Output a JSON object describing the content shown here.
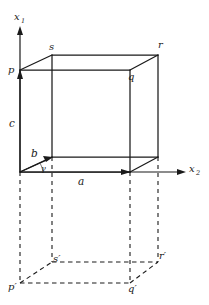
{
  "figure": {
    "type": "geometry-diagram",
    "background_color": "#ffffff",
    "line_color": "#1a1a1a",
    "axes": [
      {
        "name": "x1-axis",
        "label": "x",
        "subscript": "1",
        "direction": "up"
      },
      {
        "name": "x2-axis",
        "label": "x",
        "subscript": "2",
        "direction": "right"
      }
    ],
    "vertices": {
      "p": "p",
      "q": "q",
      "r": "r",
      "s": "s",
      "p_prime": "p",
      "q_prime": "q",
      "r_prime": "r",
      "s_prime": "s",
      "prime_mark": "′"
    },
    "edge_labels": {
      "a": "a",
      "b": "b",
      "c": "c"
    },
    "angle_labels": {
      "gamma": "γ"
    },
    "geometry": {
      "origin": [
        20,
        172
      ],
      "front_top_left": [
        20,
        70
      ],
      "front_top_right": [
        130,
        70
      ],
      "back_top_left": [
        52,
        55
      ],
      "back_top_right": [
        158,
        55
      ],
      "front_bottom_left": [
        20,
        172
      ],
      "front_bottom_right": [
        130,
        172
      ],
      "back_bottom_left": [
        52,
        157
      ],
      "back_bottom_right": [
        158,
        157
      ],
      "proj_front_left": [
        20,
        283
      ],
      "proj_front_right": [
        130,
        283
      ],
      "proj_back_left": [
        52,
        262
      ],
      "proj_back_right": [
        158,
        262
      ],
      "x1_axis_tip": [
        20,
        27
      ],
      "x2_axis_tip": [
        185,
        172
      ],
      "a_vector_tip": [
        130,
        172
      ],
      "b_vector_tip": [
        52,
        157
      ],
      "c_vector_tip": [
        20,
        70
      ]
    }
  }
}
